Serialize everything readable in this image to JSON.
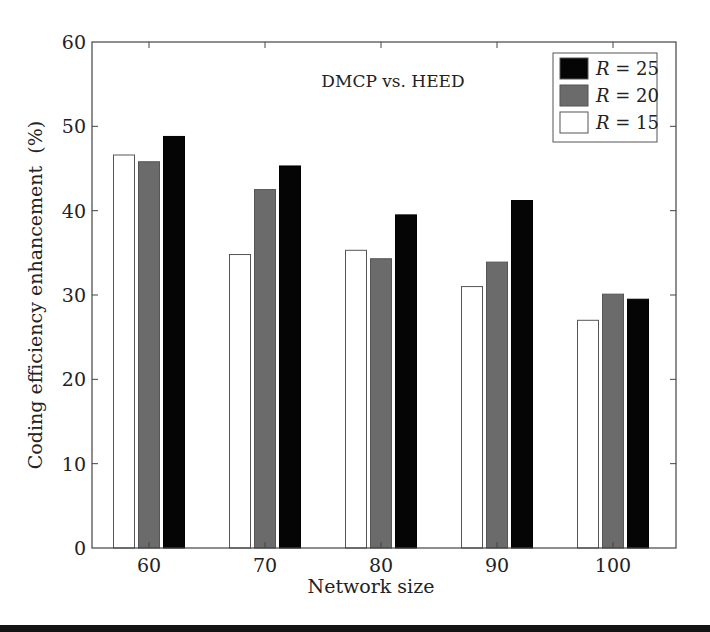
{
  "chart_data": {
    "type": "bar",
    "title": "DMCP vs. HEED",
    "xlabel": "Network size",
    "ylabel": "Coding efficiency enhancement  (%)",
    "categories": [
      "60",
      "70",
      "80",
      "90",
      "100"
    ],
    "ylim": [
      0,
      60
    ],
    "yticks": [
      0,
      10,
      20,
      30,
      40,
      50,
      60
    ],
    "grid": false,
    "legend_position": "upper right",
    "series": [
      {
        "name": "R = 15",
        "var": "R",
        "value_label": "= 15",
        "color": "#ffffff",
        "values": [
          46.6,
          34.8,
          35.3,
          31.0,
          27.0
        ]
      },
      {
        "name": "R = 20",
        "var": "R",
        "value_label": "= 20",
        "color": "#6b6b6b",
        "values": [
          45.8,
          42.5,
          34.3,
          33.9,
          30.1
        ]
      },
      {
        "name": "R = 25",
        "var": "R",
        "value_label": "= 25",
        "color": "#050505",
        "values": [
          48.8,
          45.3,
          39.5,
          41.2,
          29.5
        ]
      }
    ],
    "legend_order": [
      "R = 25",
      "R = 20",
      "R = 15"
    ]
  }
}
